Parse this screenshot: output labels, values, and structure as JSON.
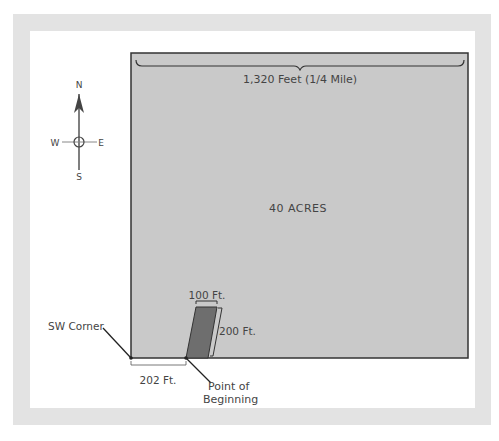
{
  "diagram": {
    "type": "land-survey-plat",
    "compass": {
      "north": "N",
      "south": "S",
      "east": "E",
      "west": "W"
    },
    "parcel": {
      "label": "40 ACRES",
      "width_label": "1,320 Feet (1/4 Mile)"
    },
    "lot": {
      "width_label": "100 Ft.",
      "depth_label": "200 Ft.",
      "offset_label": "202 Ft."
    },
    "callouts": {
      "sw_corner": "SW Corner",
      "point_of_beginning_line1": "Point of",
      "point_of_beginning_line2": "Beginning"
    },
    "colors": {
      "frame": "#e3e3e3",
      "parcel_fill": "#c9c9c9",
      "lot_fill": "#6e6e6e",
      "lines": "#333333"
    }
  }
}
